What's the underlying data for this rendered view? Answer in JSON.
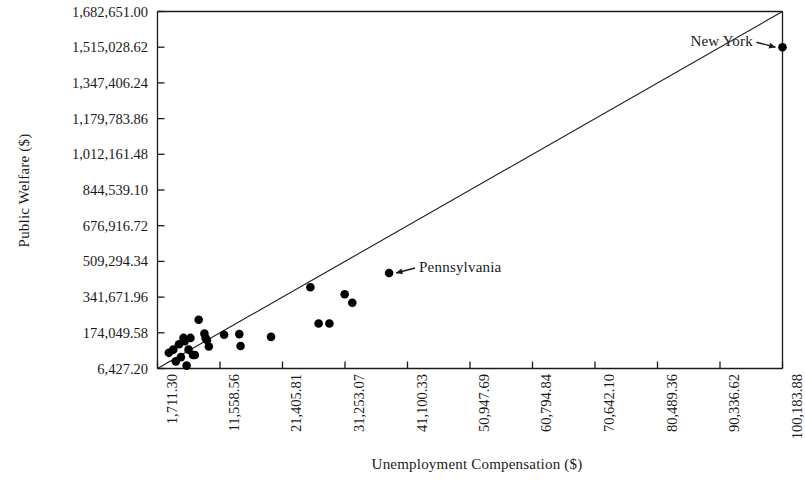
{
  "chart_data": {
    "type": "scatter",
    "title": "",
    "xlabel": "Unemployment Compensation ($)",
    "ylabel": "Public Welfare ($)",
    "xlim": [
      1711.3,
      100183.88
    ],
    "ylim": [
      6427.2,
      1682651.0
    ],
    "grid": false,
    "legend": null,
    "xticklabels": [
      "1,711.30",
      "11,558.56",
      "21,405.81",
      "31,253.07",
      "41,100.33",
      "50,947.69",
      "60,794.84",
      "70,642.10",
      "80,489.36",
      "90,336.62",
      "100,183.88"
    ],
    "xtickvalues": [
      1711.3,
      11558.56,
      21405.81,
      31253.07,
      41100.33,
      50947.69,
      60794.84,
      70642.1,
      80489.36,
      90336.62,
      100183.88
    ],
    "yticklabels": [
      "1,682,651.00",
      "1,515,028.62",
      "1,347,406.24",
      "1,179,783.86",
      "1,012,161.48",
      "844,539.10",
      "676,916.72",
      "509,294.34",
      "341,671.96",
      "174,049.58",
      "6,427.20"
    ],
    "ytickvalues": [
      1682651.0,
      1515028.62,
      1347406.24,
      1179783.86,
      1012161.48,
      844539.1,
      676916.72,
      509294.34,
      341671.96,
      174049.58,
      6427.2
    ],
    "reference_line": {
      "name": "diagonal-reference-line",
      "x": [
        1711.3,
        100183.88
      ],
      "y": [
        6427.2,
        1682651.0
      ]
    },
    "points": [
      {
        "x": 3500,
        "y": 80000
      },
      {
        "x": 4200,
        "y": 95000
      },
      {
        "x": 4600,
        "y": 40000
      },
      {
        "x": 5100,
        "y": 120000
      },
      {
        "x": 5400,
        "y": 60000
      },
      {
        "x": 5800,
        "y": 150000
      },
      {
        "x": 6000,
        "y": 135000
      },
      {
        "x": 6300,
        "y": 20000
      },
      {
        "x": 6600,
        "y": 95000
      },
      {
        "x": 6900,
        "y": 150000
      },
      {
        "x": 7300,
        "y": 70000
      },
      {
        "x": 7600,
        "y": 70000
      },
      {
        "x": 8200,
        "y": 235000
      },
      {
        "x": 9100,
        "y": 170000
      },
      {
        "x": 9300,
        "y": 148000
      },
      {
        "x": 9500,
        "y": 140000
      },
      {
        "x": 9800,
        "y": 110000
      },
      {
        "x": 12200,
        "y": 165000
      },
      {
        "x": 14600,
        "y": 168000
      },
      {
        "x": 14800,
        "y": 112000
      },
      {
        "x": 19600,
        "y": 155000
      },
      {
        "x": 25800,
        "y": 388000
      },
      {
        "x": 27100,
        "y": 218000
      },
      {
        "x": 28800,
        "y": 218000
      },
      {
        "x": 31200,
        "y": 355000
      },
      {
        "x": 32400,
        "y": 315000
      },
      {
        "x": 38200,
        "y": 455000
      },
      {
        "x": 100183,
        "y": 1515028
      }
    ],
    "annotations": [
      {
        "name": "new-york",
        "label": "New York",
        "point": {
          "x": 100183,
          "y": 1515028
        },
        "arrow_direction": "right"
      },
      {
        "name": "pennsylvania",
        "label": "Pennsylvania",
        "point": {
          "x": 38200,
          "y": 455000
        },
        "arrow_direction": "left"
      }
    ],
    "colors": {
      "marker": "#000000",
      "axis": "#1a1a1a",
      "line": "#1a1a1a",
      "background": "#ffffff"
    }
  }
}
